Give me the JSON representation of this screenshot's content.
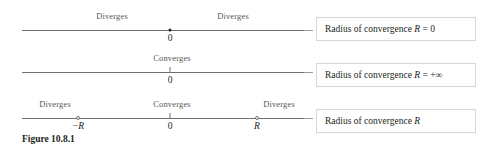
{
  "figure": {
    "caption": "Figure 10.8.1",
    "rows": [
      {
        "id": "row-zero-radius",
        "above_labels": [
          {
            "name": "diverges-left",
            "text": "Diverges",
            "x": 112
          },
          {
            "name": "diverges-right",
            "text": "Diverges",
            "x": 233
          }
        ],
        "below_labels": [
          {
            "name": "origin-label",
            "text": "0",
            "x": 170
          }
        ],
        "markers": [
          {
            "name": "point-zero",
            "type": "filled-dot",
            "x": 170
          }
        ],
        "callout": {
          "prefix": "Radius of convergence ",
          "variable": "R",
          "relation": " = 0"
        }
      },
      {
        "id": "row-infinite-radius",
        "above_labels": [
          {
            "name": "converges-center",
            "text": "Converges",
            "x": 172
          }
        ],
        "below_labels": [
          {
            "name": "origin-label",
            "text": "0",
            "x": 170
          }
        ],
        "markers": [
          {
            "name": "tick-zero",
            "type": "tick",
            "x": 170
          }
        ],
        "callout": {
          "prefix": "Radius of convergence ",
          "variable": "R",
          "relation": " = +∞"
        }
      },
      {
        "id": "row-finite-radius",
        "above_labels": [
          {
            "name": "diverges-left",
            "text": "Diverges",
            "x": 55
          },
          {
            "name": "converges-center",
            "text": "Converges",
            "x": 172
          },
          {
            "name": "diverges-right",
            "text": "Diverges",
            "x": 279
          }
        ],
        "below_labels": [
          {
            "name": "negative-radius-label",
            "text": "−R",
            "x": 78
          },
          {
            "name": "origin-label",
            "text": "0",
            "x": 170
          },
          {
            "name": "positive-radius-label",
            "text": "R",
            "x": 257
          }
        ],
        "markers": [
          {
            "name": "point-negative-radius",
            "type": "open-dot",
            "x": 78
          },
          {
            "name": "tick-zero",
            "type": "tick",
            "x": 170
          },
          {
            "name": "point-positive-radius",
            "type": "open-dot",
            "x": 257
          }
        ],
        "callout": {
          "prefix": "Radius of convergence ",
          "variable": "R",
          "relation": ""
        }
      }
    ]
  },
  "colors": {
    "axis": "#6f6f73",
    "above_label_text": "#58585b",
    "body_text": "#231f20",
    "callout_border": "#d5d5d8",
    "connector": "#9a9a9e",
    "background": "#ffffff"
  }
}
